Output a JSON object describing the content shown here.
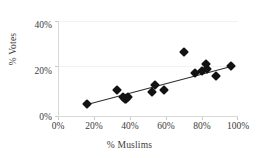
{
  "chart_data": {
    "type": "scatter",
    "title": "",
    "xlabel": "% Muslims",
    "ylabel": "% Votes",
    "xlim": [
      0,
      100
    ],
    "ylim": [
      0,
      40
    ],
    "xticks": [
      "0%",
      "20%",
      "40%",
      "60%",
      "80%",
      "100%"
    ],
    "xtick_values": [
      0,
      20,
      40,
      60,
      80,
      100
    ],
    "yticks": [
      "0%",
      "20%",
      "40%"
    ],
    "ytick_values": [
      0,
      20,
      40
    ],
    "grid": "horizontal",
    "legend": "none",
    "marker": "diamond",
    "marker_color": "#121212",
    "trendline": {
      "visible": true,
      "color": "#2e2e2e",
      "x_start": 16,
      "y_start": 5,
      "x_end": 96,
      "y_end": 21
    },
    "points": [
      {
        "x": 16,
        "y": 5
      },
      {
        "x": 33,
        "y": 11
      },
      {
        "x": 36,
        "y": 8
      },
      {
        "x": 37,
        "y": 7
      },
      {
        "x": 38,
        "y": 7
      },
      {
        "x": 39,
        "y": 8
      },
      {
        "x": 52,
        "y": 10
      },
      {
        "x": 54,
        "y": 13
      },
      {
        "x": 59,
        "y": 11
      },
      {
        "x": 70,
        "y": 27
      },
      {
        "x": 76,
        "y": 18
      },
      {
        "x": 80,
        "y": 19
      },
      {
        "x": 82,
        "y": 22
      },
      {
        "x": 83,
        "y": 20
      },
      {
        "x": 88,
        "y": 17
      },
      {
        "x": 96,
        "y": 21
      }
    ]
  },
  "colors": {
    "background": "#ffffff",
    "marker": "#121212",
    "grid": "#f2f2f2",
    "axis": "#d9d9d9",
    "text": "#3a3a3a"
  }
}
